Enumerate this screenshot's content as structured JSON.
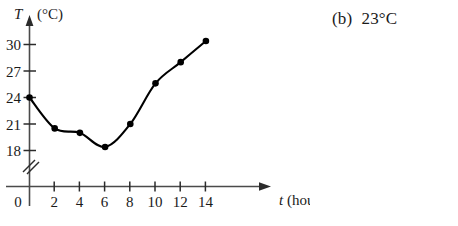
{
  "answer": {
    "part_label": "(b)",
    "value": "23°C"
  },
  "chart_data": {
    "type": "line",
    "title": "",
    "xlabel": "t (hours)",
    "ylabel": "T (°C)",
    "x_axis_symbol": "t",
    "x_axis_unit": "(hours)",
    "y_axis_symbol": "T",
    "y_axis_unit": "(°C)",
    "x": [
      0,
      2,
      4,
      6,
      8,
      10,
      12,
      14
    ],
    "values": [
      24,
      20.5,
      20,
      18.4,
      21,
      25.6,
      28,
      30.4
    ],
    "xticks": [
      0,
      2,
      4,
      6,
      8,
      10,
      12,
      14
    ],
    "xtick_labels": [
      "0",
      "2",
      "4",
      "6",
      "8",
      "10",
      "12",
      "14"
    ],
    "yticks": [
      18,
      21,
      24,
      27,
      30
    ],
    "ytick_labels": [
      "18",
      "21",
      "24",
      "27",
      "30"
    ],
    "origin_label": "0",
    "xlim": [
      0,
      14
    ],
    "ylim": [
      18,
      30
    ],
    "grid": false,
    "legend": null,
    "axis_break": "y-axis break below 18",
    "marker": "filled-circle",
    "line_color": "#000000",
    "marker_color": "#000000",
    "axis_color": "#3a3a3a",
    "background": "#ffffff"
  }
}
